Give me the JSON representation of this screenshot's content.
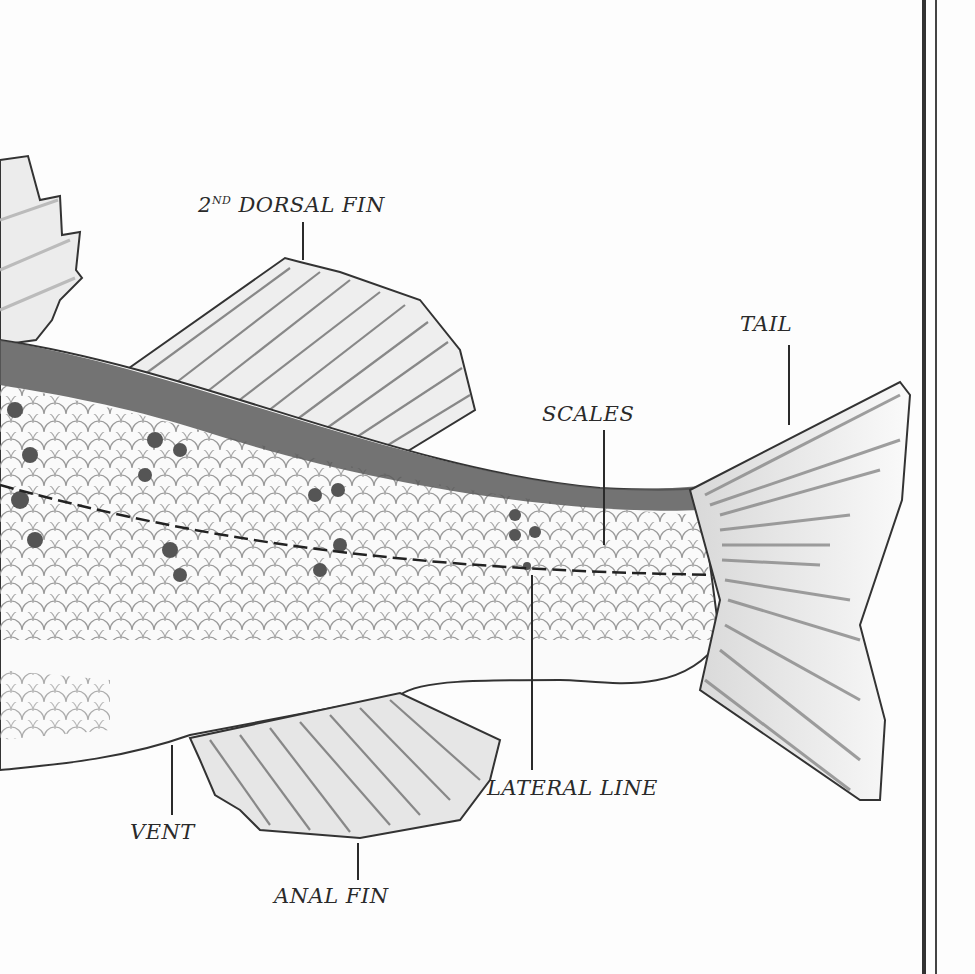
{
  "diagram": {
    "colors": {
      "ink": "#2a2a2a",
      "dorsal_stripe": "#5a5a5a",
      "paper": "#fdfdfd",
      "fin_shade": "#c8c8c8"
    },
    "labels": {
      "second_dorsal_fin": {
        "text_prefix": "2",
        "text_sup": "ND",
        "text_main": " DORSAL FIN"
      },
      "tail": "TAIL",
      "scales": "SCALES",
      "lateral_line": "LATERAL LINE",
      "vent": "VENT",
      "anal_fin": "ANAL FIN"
    },
    "border": "double vertical rule at right edge"
  }
}
